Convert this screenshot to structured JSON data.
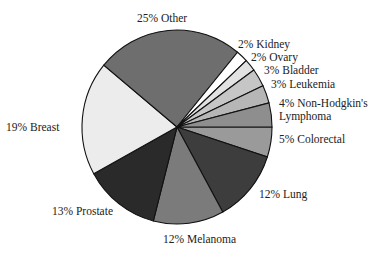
{
  "chart_data": {
    "type": "pie",
    "title": "",
    "start_angle_deg": 0,
    "direction": "clockwise",
    "slices": [
      {
        "name": "Colorectal",
        "value": 5,
        "label": "5% Colorectal",
        "color": "#9a9a9a"
      },
      {
        "name": "Lung",
        "value": 12,
        "label": "12% Lung",
        "color": "#3d3d3d"
      },
      {
        "name": "Melanoma",
        "value": 12,
        "label": "12% Melanoma",
        "color": "#7b7b7b"
      },
      {
        "name": "Prostate",
        "value": 13,
        "label": "13% Prostate",
        "color": "#2a2a2a"
      },
      {
        "name": "Breast",
        "value": 19,
        "label": "19% Breast",
        "color": "#ececec"
      },
      {
        "name": "Other",
        "value": 25,
        "label": "25% Other",
        "color": "#6e6e6e"
      },
      {
        "name": "Kidney",
        "value": 2,
        "label": "2% Kidney",
        "color": "#ffffff"
      },
      {
        "name": "Ovary",
        "value": 2,
        "label": "2% Ovary",
        "color": "#e2e2e2"
      },
      {
        "name": "Bladder",
        "value": 3,
        "label": "3% Bladder",
        "color": "#c6c6c6"
      },
      {
        "name": "Leukemia",
        "value": 3,
        "label": "3% Leukemia",
        "color": "#b6b6b6"
      },
      {
        "name": "Non-Hodgkin's Lymphoma",
        "value": 4,
        "label": "4% Non-Hodgkin's Lymphoma",
        "color": "#8e8e8e"
      }
    ],
    "categories": [
      "Colorectal",
      "Lung",
      "Melanoma",
      "Prostate",
      "Breast",
      "Other",
      "Kidney",
      "Ovary",
      "Bladder",
      "Leukemia",
      "Non-Hodgkin's Lymphoma"
    ],
    "values": [
      5,
      12,
      12,
      13,
      19,
      25,
      2,
      2,
      3,
      3,
      4
    ],
    "legend": "none (direct labels)"
  },
  "labels": {
    "other": "25% Other",
    "kidney": "2% Kidney",
    "ovary": "2% Ovary",
    "bladder": "3% Bladder",
    "leukemia": "3% Leukemia",
    "nhl_line1": "4% Non-Hodgkin's",
    "nhl_line2": "Lymphoma",
    "colorectal": "5% Colorectal",
    "lung": "12% Lung",
    "melanoma": "12% Melanoma",
    "prostate": "13% Prostate",
    "breast": "19% Breast"
  }
}
